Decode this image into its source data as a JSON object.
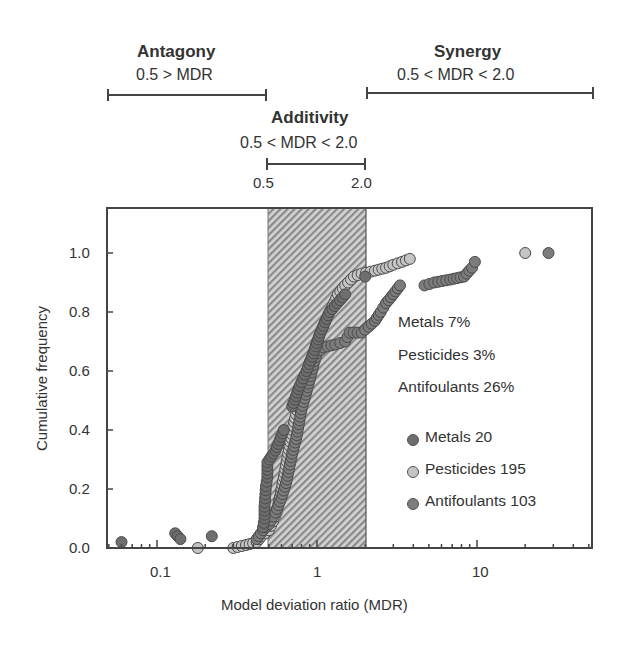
{
  "header": {
    "antagony": {
      "label": "Antagony",
      "range": "0.5 > MDR"
    },
    "additivity": {
      "label": "Additivity",
      "range": "0.5 < MDR < 2.0",
      "lower": "0.5",
      "upper": "2.0"
    },
    "synergy": {
      "label": "Synergy",
      "range": "0.5 < MDR < 2.0"
    }
  },
  "axes": {
    "xlabel": "Model deviation ratio (MDR)",
    "ylabel": "Cumulative frequency",
    "xticks": [
      "0.1",
      "1",
      "10"
    ],
    "yticks": [
      "0.0",
      "0.2",
      "0.4",
      "0.6",
      "0.8",
      "1.0"
    ]
  },
  "annotations": {
    "metals_pct": "Metals 7%",
    "pesticides_pct": "Pesticides 3%",
    "antifoulants_pct": "Antifoulants 26%"
  },
  "legend": {
    "metals": "Metals 20",
    "pesticides": "Pesticides 195",
    "antifoulants": "Antifoulants 103"
  },
  "colors": {
    "metals": "#6e6e6e",
    "pesticides": "#c4c4c4",
    "antifoulants": "#7c7c7c",
    "hatch_dark": "#8a8a8a",
    "hatch_light": "#d0d0d0",
    "axis": "#444444"
  },
  "chart_data": {
    "type": "scatter",
    "title": "",
    "xlabel": "Model deviation ratio (MDR)",
    "ylabel": "Cumulative frequency",
    "xscale": "log",
    "xlim": [
      0.049,
      52
    ],
    "ylim": [
      0.0,
      1.15
    ],
    "xticks": [
      0.1,
      1,
      10
    ],
    "yticks": [
      0.0,
      0.2,
      0.4,
      0.6,
      0.8,
      1.0
    ],
    "grid": false,
    "legend_position": "lower right",
    "shaded_region": {
      "x": [
        0.5,
        2.0
      ],
      "label": "Additivity",
      "pattern": "hatched"
    },
    "regions": [
      {
        "name": "Antagony",
        "condition": "0.5 > MDR"
      },
      {
        "name": "Additivity",
        "condition": "0.5 < MDR < 2.0"
      },
      {
        "name": "Synergy",
        "condition": "0.5 < MDR < 2.0"
      }
    ],
    "percent_synergy": [
      {
        "group": "Metals",
        "percent": 7
      },
      {
        "group": "Pesticides",
        "percent": 3
      },
      {
        "group": "Antifoulants",
        "percent": 26
      }
    ],
    "series": [
      {
        "name": "Metals",
        "n": 20,
        "points": [
          [
            0.06,
            0.02
          ],
          [
            0.13,
            0.05
          ],
          [
            0.14,
            0.03
          ],
          [
            0.22,
            0.04
          ],
          [
            0.46,
            0.07
          ],
          [
            0.47,
            0.1
          ],
          [
            0.47,
            0.14
          ],
          [
            0.48,
            0.21
          ],
          [
            0.49,
            0.24
          ],
          [
            0.49,
            0.29
          ],
          [
            0.55,
            0.33
          ],
          [
            0.62,
            0.4
          ],
          [
            0.7,
            0.48
          ],
          [
            0.78,
            0.55
          ],
          [
            0.86,
            0.6
          ],
          [
            0.95,
            0.66
          ],
          [
            1.05,
            0.73
          ],
          [
            1.2,
            0.8
          ],
          [
            1.5,
            0.86
          ],
          [
            2.0,
            0.92
          ]
        ]
      },
      {
        "name": "Pesticides",
        "n": 195,
        "points": [
          [
            0.18,
            0.0
          ],
          [
            0.3,
            0.0
          ],
          [
            0.36,
            0.01
          ],
          [
            0.42,
            0.02
          ],
          [
            0.45,
            0.04
          ],
          [
            0.5,
            0.06
          ],
          [
            0.53,
            0.09
          ],
          [
            0.56,
            0.12
          ],
          [
            0.58,
            0.16
          ],
          [
            0.6,
            0.2
          ],
          [
            0.62,
            0.24
          ],
          [
            0.64,
            0.28
          ],
          [
            0.66,
            0.32
          ],
          [
            0.68,
            0.36
          ],
          [
            0.7,
            0.4
          ],
          [
            0.73,
            0.44
          ],
          [
            0.76,
            0.48
          ],
          [
            0.8,
            0.52
          ],
          [
            0.83,
            0.56
          ],
          [
            0.87,
            0.6
          ],
          [
            0.9,
            0.63
          ],
          [
            0.95,
            0.66
          ],
          [
            1.0,
            0.7
          ],
          [
            1.07,
            0.74
          ],
          [
            1.15,
            0.78
          ],
          [
            1.25,
            0.82
          ],
          [
            1.35,
            0.86
          ],
          [
            1.5,
            0.89
          ],
          [
            1.7,
            0.92
          ],
          [
            1.9,
            0.93
          ],
          [
            2.3,
            0.94
          ],
          [
            2.7,
            0.95
          ],
          [
            3.0,
            0.96
          ],
          [
            3.4,
            0.97
          ],
          [
            3.8,
            0.98
          ],
          [
            20.0,
            1.0
          ]
        ]
      },
      {
        "name": "Antifoulants",
        "n": 103,
        "points": [
          [
            0.42,
            0.03
          ],
          [
            0.46,
            0.06
          ],
          [
            0.5,
            0.08
          ],
          [
            0.55,
            0.12
          ],
          [
            0.6,
            0.17
          ],
          [
            0.64,
            0.22
          ],
          [
            0.67,
            0.27
          ],
          [
            0.7,
            0.32
          ],
          [
            0.74,
            0.37
          ],
          [
            0.77,
            0.42
          ],
          [
            0.8,
            0.47
          ],
          [
            0.85,
            0.52
          ],
          [
            0.9,
            0.57
          ],
          [
            0.95,
            0.62
          ],
          [
            1.0,
            0.66
          ],
          [
            1.1,
            0.68
          ],
          [
            1.3,
            0.69
          ],
          [
            1.5,
            0.7
          ],
          [
            1.6,
            0.73
          ],
          [
            1.9,
            0.73
          ],
          [
            2.1,
            0.75
          ],
          [
            2.3,
            0.77
          ],
          [
            2.5,
            0.8
          ],
          [
            2.7,
            0.83
          ],
          [
            3.0,
            0.86
          ],
          [
            3.3,
            0.89
          ],
          [
            4.7,
            0.89
          ],
          [
            5.4,
            0.9
          ],
          [
            6.8,
            0.91
          ],
          [
            8.3,
            0.92
          ],
          [
            9.3,
            0.95
          ],
          [
            9.7,
            0.97
          ],
          [
            28.0,
            1.0
          ]
        ]
      }
    ]
  }
}
